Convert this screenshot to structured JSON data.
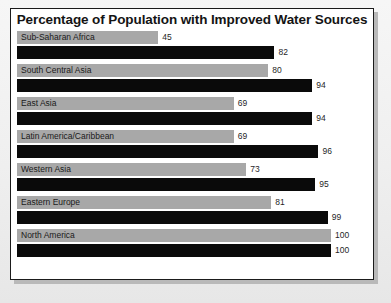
{
  "chart_data": {
    "type": "bar",
    "orientation": "horizontal",
    "title": "Percentage of Population with Improved Water Sources",
    "xlabel": "",
    "ylabel": "",
    "xlim": [
      0,
      100
    ],
    "grid": false,
    "legend": "none",
    "categories": [
      "Sub-Saharan Africa",
      "South Central Asia",
      "East Asia",
      "Latin America/Caribbean",
      "Western Asia",
      "Eastern Europe",
      "North America"
    ],
    "series": [
      {
        "name": "series-a",
        "color": "#a8a8a8",
        "values": [
          45,
          80,
          69,
          69,
          73,
          81,
          100
        ]
      },
      {
        "name": "series-b",
        "color": "#0a0a0a",
        "values": [
          82,
          94,
          94,
          96,
          95,
          99,
          100
        ]
      }
    ],
    "value_labels": [
      [
        "45",
        "82"
      ],
      [
        "80",
        "94"
      ],
      [
        "69",
        "94"
      ],
      [
        "69",
        "96"
      ],
      [
        "73",
        "95"
      ],
      [
        "81",
        "99"
      ],
      [
        "100",
        "100"
      ]
    ]
  }
}
